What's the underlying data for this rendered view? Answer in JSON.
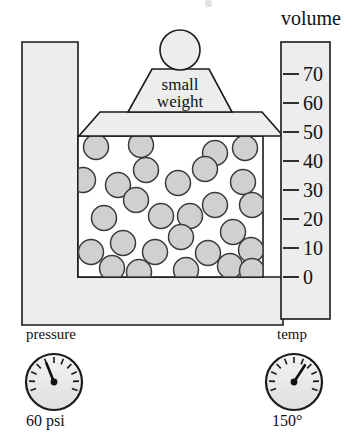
{
  "diagram": {
    "title_partial_cut_off_at_top": "",
    "volume_scale": {
      "label": "volume",
      "ticks": [
        {
          "value": "70",
          "y": 74
        },
        {
          "value": "60",
          "y": 103
        },
        {
          "value": "50",
          "y": 132
        },
        {
          "value": "40",
          "y": 161
        },
        {
          "value": "30",
          "y": 190
        },
        {
          "value": "20",
          "y": 219
        },
        {
          "value": "10",
          "y": 248
        },
        {
          "value": "0",
          "y": 277
        }
      ],
      "current_reading": "50",
      "unit_min": "0",
      "unit_max": "70"
    },
    "weight": {
      "label_line1": "small",
      "label_line2": "weight",
      "knob": "ball-knob"
    },
    "piston": {
      "name": "piston-plate",
      "rests_at_volume": "50"
    },
    "gas": {
      "particle_count": 28,
      "particle_fill": "#d0d0d0",
      "particle_stroke": "#3a3a3a",
      "particles": [
        {
          "cx": 96,
          "cy": 147
        },
        {
          "cx": 141,
          "cy": 145
        },
        {
          "cx": 215,
          "cy": 153
        },
        {
          "cx": 245,
          "cy": 148
        },
        {
          "cx": 83,
          "cy": 180
        },
        {
          "cx": 118,
          "cy": 185
        },
        {
          "cx": 146,
          "cy": 170
        },
        {
          "cx": 178,
          "cy": 183
        },
        {
          "cx": 205,
          "cy": 169
        },
        {
          "cx": 243,
          "cy": 182
        },
        {
          "cx": 136,
          "cy": 200
        },
        {
          "cx": 161,
          "cy": 216
        },
        {
          "cx": 252,
          "cy": 205
        },
        {
          "cx": 104,
          "cy": 218
        },
        {
          "cx": 190,
          "cy": 216
        },
        {
          "cx": 215,
          "cy": 205
        },
        {
          "cx": 181,
          "cy": 237
        },
        {
          "cx": 233,
          "cy": 232
        },
        {
          "cx": 123,
          "cy": 243
        },
        {
          "cx": 155,
          "cy": 252
        },
        {
          "cx": 91,
          "cy": 252
        },
        {
          "cx": 208,
          "cy": 253
        },
        {
          "cx": 251,
          "cy": 250
        },
        {
          "cx": 112,
          "cy": 268
        },
        {
          "cx": 139,
          "cy": 272
        },
        {
          "cx": 186,
          "cy": 270
        },
        {
          "cx": 230,
          "cy": 266
        },
        {
          "cx": 252,
          "cy": 271
        }
      ]
    },
    "gauges": [
      {
        "name": "pressure-gauge",
        "title": "pressure",
        "value": "60 psi",
        "needle_angle_deg": -22,
        "cx": 54,
        "cy": 382,
        "r": 28
      },
      {
        "name": "temp-gauge",
        "title": "temp",
        "value": "150°",
        "needle_angle_deg": 33,
        "cx": 294,
        "cy": 382,
        "r": 28
      }
    ],
    "colors": {
      "outline": "#1a1a1a",
      "body_fill": "#eeeeee",
      "chamber_fill": "#ffffff",
      "particle_fill": "#d0d0d0",
      "gauge_face": "#ececec"
    }
  }
}
